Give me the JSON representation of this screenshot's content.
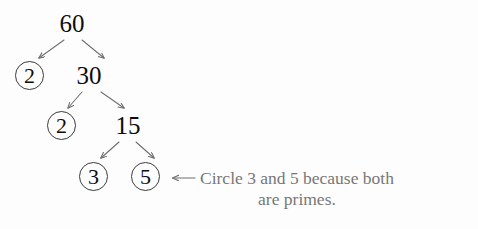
{
  "diagram": {
    "type": "factor-tree",
    "title_number": "60",
    "colors": {
      "background": "#fdfdfd",
      "node_text": "#0d0d0d",
      "circle_stroke": "#3b3b3b",
      "arrow": "#6e6e6e",
      "annotation_text": "#777777"
    },
    "nodes": [
      {
        "id": "n60",
        "label": "60",
        "circled": false,
        "x": 54,
        "y": 10,
        "w": 36,
        "h": 26
      },
      {
        "id": "n2a",
        "label": "2",
        "circled": true,
        "x": 15,
        "y": 61,
        "w": 29,
        "h": 29
      },
      {
        "id": "n30",
        "label": "30",
        "circled": false,
        "x": 70,
        "y": 62,
        "w": 38,
        "h": 26
      },
      {
        "id": "n2b",
        "label": "2",
        "circled": true,
        "x": 47,
        "y": 111,
        "w": 29,
        "h": 29
      },
      {
        "id": "n15",
        "label": "15",
        "circled": false,
        "x": 110,
        "y": 112,
        "w": 36,
        "h": 26
      },
      {
        "id": "n3",
        "label": "3",
        "circled": true,
        "x": 79,
        "y": 162,
        "w": 29,
        "h": 29
      },
      {
        "id": "n5",
        "label": "5",
        "circled": true,
        "x": 131,
        "y": 162,
        "w": 29,
        "h": 29
      }
    ],
    "edges": [
      {
        "from": "n60",
        "to": "n2a",
        "x1": 64,
        "y1": 40,
        "x2": 39,
        "y2": 58
      },
      {
        "from": "n60",
        "to": "n30",
        "x1": 82,
        "y1": 40,
        "x2": 104,
        "y2": 58
      },
      {
        "from": "n30",
        "to": "n2b",
        "x1": 82,
        "y1": 92,
        "x2": 68,
        "y2": 108
      },
      {
        "from": "n30",
        "to": "n15",
        "x1": 101,
        "y1": 92,
        "x2": 124,
        "y2": 108
      },
      {
        "from": "n15",
        "to": "n3",
        "x1": 119,
        "y1": 142,
        "x2": 101,
        "y2": 158
      },
      {
        "from": "n15",
        "to": "n5",
        "x1": 136,
        "y1": 142,
        "x2": 154,
        "y2": 158
      }
    ],
    "callout": {
      "arrow": {
        "x1": 195,
        "y1": 178,
        "x2": 172,
        "y2": 178,
        "direction": "left"
      },
      "line1": "Circle 3 and 5 because both",
      "line2": "are primes.",
      "x": 200,
      "y": 168
    }
  }
}
